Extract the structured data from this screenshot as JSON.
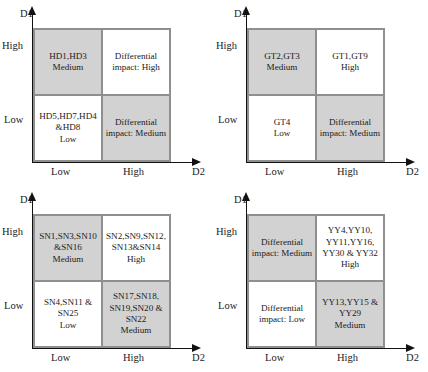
{
  "figure": {
    "type": "four-quadrant-matrix-set",
    "axis_y_label": "D1",
    "axis_x_label": "D2",
    "tick_y_high": "High",
    "tick_y_low": "Low",
    "tick_x_low": "Low",
    "tick_x_high": "High",
    "shade_color": "#d2d2d2",
    "line_color": "#8f8f8f"
  },
  "panels": [
    {
      "id": "panel-hd",
      "cells": {
        "top_left": {
          "text": "HD1,HD3\nMedium",
          "shaded": true
        },
        "top_right": {
          "text": "Differential\nimpact: High",
          "shaded": false
        },
        "bottom_left": {
          "text": "HD5,HD7,HD4\n&HD8\nLow",
          "shaded": false
        },
        "bottom_right": {
          "text": "Differential\nimpact: Medium",
          "shaded": true
        }
      }
    },
    {
      "id": "panel-gt",
      "cells": {
        "top_left": {
          "text": "GT2,GT3\nMedium",
          "shaded": true
        },
        "top_right": {
          "text": "GT1,GT9\nHigh",
          "shaded": false
        },
        "bottom_left": {
          "text": "GT4\nLow",
          "shaded": false
        },
        "bottom_right": {
          "text": "Differential\nimpact: Medium",
          "shaded": true
        }
      }
    },
    {
      "id": "panel-sn",
      "cells": {
        "top_left": {
          "text": "SN1,SN3,SN10\n&SN16\nMedium",
          "shaded": true
        },
        "top_right": {
          "text": "SN2,SN9,SN12,\nSN13&SN14\nHigh",
          "shaded": false
        },
        "bottom_left": {
          "text": "SN4,SN11 &\nSN25\nLow",
          "shaded": false
        },
        "bottom_right": {
          "text": "SN17,SN18,\nSN19,SN20 &\nSN22\nMedium",
          "shaded": true
        }
      }
    },
    {
      "id": "panel-yy",
      "cells": {
        "top_left": {
          "text": "Differential\nimpact: Medium",
          "shaded": true
        },
        "top_right": {
          "text": "YY4,YY10,\nYY11,YY16,\nYY30 & YY32\nHigh",
          "shaded": false
        },
        "bottom_left": {
          "text": "Differential\nimpact: Low",
          "shaded": false
        },
        "bottom_right": {
          "text": "YY13,YY15 &\nYY29\nMedium",
          "shaded": true
        }
      }
    }
  ]
}
